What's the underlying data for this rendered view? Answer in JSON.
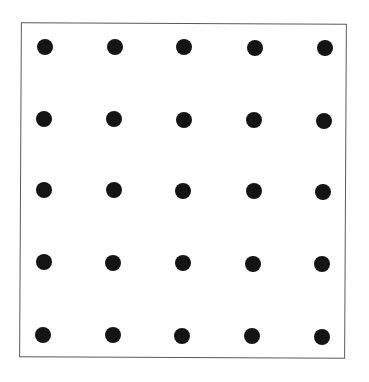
{
  "diagram": {
    "type": "dot-grid",
    "rows": 5,
    "columns": 5,
    "frame": {
      "border_color": "#5a5a5a",
      "background": "#ffffff"
    },
    "dot_color": "#141414",
    "dot_diameter": 16,
    "dots": [
      [
        {
          "x": 45,
          "y": 47
        },
        {
          "x": 115,
          "y": 47
        },
        {
          "x": 184,
          "y": 47
        },
        {
          "x": 255,
          "y": 48
        },
        {
          "x": 325,
          "y": 48
        }
      ],
      [
        {
          "x": 44,
          "y": 119
        },
        {
          "x": 114,
          "y": 119
        },
        {
          "x": 184,
          "y": 120
        },
        {
          "x": 254,
          "y": 120
        },
        {
          "x": 324,
          "y": 121
        }
      ],
      [
        {
          "x": 44,
          "y": 190
        },
        {
          "x": 114,
          "y": 190
        },
        {
          "x": 183,
          "y": 191
        },
        {
          "x": 254,
          "y": 191
        },
        {
          "x": 323,
          "y": 192
        }
      ],
      [
        {
          "x": 44,
          "y": 262
        },
        {
          "x": 113,
          "y": 263
        },
        {
          "x": 183,
          "y": 263
        },
        {
          "x": 253,
          "y": 264
        },
        {
          "x": 322,
          "y": 264
        }
      ],
      [
        {
          "x": 43,
          "y": 335
        },
        {
          "x": 113,
          "y": 335
        },
        {
          "x": 182,
          "y": 336
        },
        {
          "x": 252,
          "y": 336
        },
        {
          "x": 322,
          "y": 337
        }
      ]
    ]
  }
}
